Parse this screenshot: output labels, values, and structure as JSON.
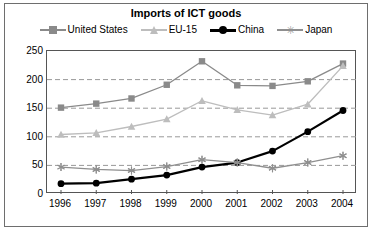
{
  "chart_data": {
    "type": "line",
    "title": "Imports of ICT goods",
    "xlabel": "",
    "ylabel": "",
    "x": [
      "1996",
      "1997",
      "1998",
      "1999",
      "2000",
      "2001",
      "2002",
      "2003",
      "2004"
    ],
    "categories": [
      "1996",
      "1997",
      "1998",
      "1999",
      "2000",
      "2001",
      "2002",
      "2003",
      "2004"
    ],
    "ylim": [
      0,
      250
    ],
    "yticks": [
      0,
      50,
      100,
      150,
      200,
      250
    ],
    "ytick_labels": [
      "0",
      "50",
      "100",
      "150",
      "200",
      "250"
    ],
    "grid": "horizontal-dashed",
    "legend_position": "top-center",
    "series": [
      {
        "name": "United States",
        "marker": "square",
        "color": "#8a8a8a",
        "values": [
          151,
          158,
          167,
          191,
          232,
          190,
          189,
          197,
          228
        ]
      },
      {
        "name": "EU-15",
        "marker": "triangle",
        "color": "#bdbdbd",
        "values": [
          104,
          107,
          118,
          131,
          163,
          147,
          138,
          157,
          224
        ]
      },
      {
        "name": "China",
        "marker": "circle",
        "color": "#000000",
        "values": [
          18,
          19,
          26,
          33,
          47,
          55,
          75,
          109,
          146
        ]
      },
      {
        "name": "Japan",
        "marker": "star",
        "color": "#8f8f8f",
        "values": [
          47,
          43,
          41,
          48,
          60,
          55,
          45,
          55,
          67
        ]
      }
    ]
  },
  "legend": {
    "items": [
      {
        "label": "United States",
        "marker": "square",
        "color": "#8a8a8a"
      },
      {
        "label": "EU-15",
        "marker": "triangle",
        "color": "#bdbdbd"
      },
      {
        "label": "China",
        "marker": "circle",
        "color": "#000000"
      },
      {
        "label": "Japan",
        "marker": "star",
        "color": "#8f8f8f"
      }
    ]
  },
  "colors": {
    "united_states": "#8a8a8a",
    "eu15": "#bdbdbd",
    "china": "#000000",
    "japan": "#8f8f8f",
    "grid": "#999999",
    "axis": "#555555",
    "background": "#ffffff"
  },
  "icons": {
    "square_marker": "square-marker-icon",
    "triangle_marker": "triangle-marker-icon",
    "circle_marker": "circle-marker-icon",
    "star_marker": "star-marker-icon"
  }
}
